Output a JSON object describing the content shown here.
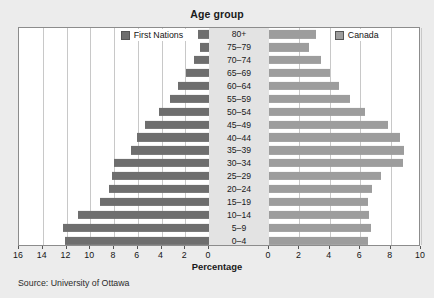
{
  "chart_data": {
    "type": "bar",
    "subtype": "population-pyramid",
    "title": "Age group",
    "xlabel": "Percentage",
    "ylabel": "",
    "source": "Source: University of Ottawa",
    "categories": [
      "80+",
      "75–79",
      "70–74",
      "65–69",
      "60–64",
      "55–59",
      "50–54",
      "45–49",
      "40–44",
      "35–39",
      "30–34",
      "25–29",
      "20–24",
      "15–19",
      "10–14",
      "5–9",
      "0–4"
    ],
    "series": [
      {
        "name": "First Nations",
        "side": "left",
        "color": "#6e6e6e",
        "values": [
          0.9,
          0.8,
          1.3,
          1.9,
          2.6,
          3.3,
          4.2,
          5.4,
          6.1,
          6.6,
          8.0,
          8.2,
          8.4,
          9.2,
          11.0,
          12.3,
          12.1
        ]
      },
      {
        "name": "Canada",
        "side": "right",
        "color": "#9d9d9d",
        "values": [
          3.1,
          2.6,
          3.4,
          4.0,
          4.6,
          5.3,
          6.3,
          7.8,
          8.6,
          8.9,
          8.8,
          7.4,
          6.8,
          6.5,
          6.6,
          6.7,
          6.5
        ]
      }
    ],
    "left_axis": {
      "ticks": [
        16,
        14,
        12,
        10,
        8,
        6,
        4,
        2,
        0
      ],
      "min": 0,
      "max": 16,
      "direction": "reversed"
    },
    "right_axis": {
      "ticks": [
        0,
        2,
        4,
        6,
        8,
        10
      ],
      "min": 0,
      "max": 10,
      "direction": "normal"
    },
    "grid": true,
    "legend_position": "inside-top"
  },
  "legend": {
    "left": {
      "label": "First Nations",
      "color": "#6e6e6e"
    },
    "right": {
      "label": "Canada",
      "color": "#9d9d9d"
    }
  },
  "axis": {
    "title": "Percentage"
  },
  "footer": {
    "source": "Source: University of Ottawa"
  }
}
